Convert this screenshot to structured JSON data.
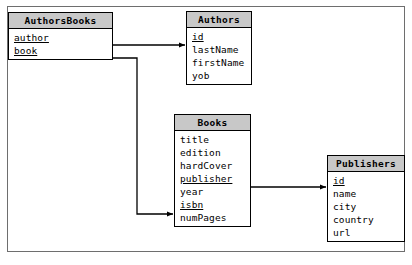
{
  "diagram": {
    "type": "entity-relationship-diagram",
    "colors": {
      "header_fill": "#c8c8c8",
      "body_fill": "#ffffff",
      "border": "#000000",
      "frame_border": "#6e6e6e",
      "connector": "#000000"
    },
    "entities": [
      {
        "name": "AuthorsBooks",
        "title": "AuthorsBooks",
        "fields": [
          {
            "label": "author",
            "key": true
          },
          {
            "label": "book",
            "key": true
          }
        ]
      },
      {
        "name": "Authors",
        "title": "Authors",
        "fields": [
          {
            "label": "id",
            "key": true
          },
          {
            "label": "lastName",
            "key": false
          },
          {
            "label": "firstName",
            "key": false
          },
          {
            "label": "yob",
            "key": false
          }
        ]
      },
      {
        "name": "Books",
        "title": "Books",
        "fields": [
          {
            "label": "title",
            "key": false
          },
          {
            "label": "edition",
            "key": false
          },
          {
            "label": "hardCover",
            "key": false
          },
          {
            "label": "publisher",
            "key": true
          },
          {
            "label": "year",
            "key": false
          },
          {
            "label": "isbn",
            "key": true
          },
          {
            "label": "numPages",
            "key": false
          }
        ]
      },
      {
        "name": "Publishers",
        "title": "Publishers",
        "fields": [
          {
            "label": "id",
            "key": true
          },
          {
            "label": "name",
            "key": false
          },
          {
            "label": "city",
            "key": false
          },
          {
            "label": "country",
            "key": false
          },
          {
            "label": "url",
            "key": false
          }
        ]
      }
    ],
    "relationships": [
      {
        "name": "authorsbooks-author-to-authors-id",
        "from_entity": "AuthorsBooks",
        "from_field": "author",
        "to_entity": "Authors",
        "to_field": "id",
        "arrow": "to"
      },
      {
        "name": "authorsbooks-book-to-books-isbn",
        "from_entity": "AuthorsBooks",
        "from_field": "book",
        "to_entity": "Books",
        "to_field": "isbn",
        "arrow": "to"
      },
      {
        "name": "books-publisher-to-publishers-id",
        "from_entity": "Books",
        "from_field": "publisher",
        "to_entity": "Publishers",
        "to_field": "id",
        "arrow": "to"
      }
    ]
  }
}
